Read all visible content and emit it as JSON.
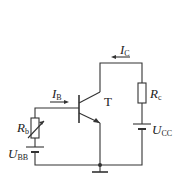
{
  "diagram": {
    "type": "circuit",
    "components": {
      "transistor": {
        "label": "T"
      },
      "base_resistor": {
        "symbol": "R",
        "subscript": "b"
      },
      "collector_resistor": {
        "symbol": "R",
        "subscript": "c"
      },
      "base_supply": {
        "symbol": "U",
        "subscript": "BB"
      },
      "collector_supply": {
        "symbol": "U",
        "subscript": "CC"
      }
    },
    "currents": {
      "base": {
        "symbol": "I",
        "subscript": "B"
      },
      "collector": {
        "symbol": "I",
        "subscript": "C"
      }
    },
    "colors": {
      "stroke": "#333333",
      "background": "#ffffff"
    }
  }
}
